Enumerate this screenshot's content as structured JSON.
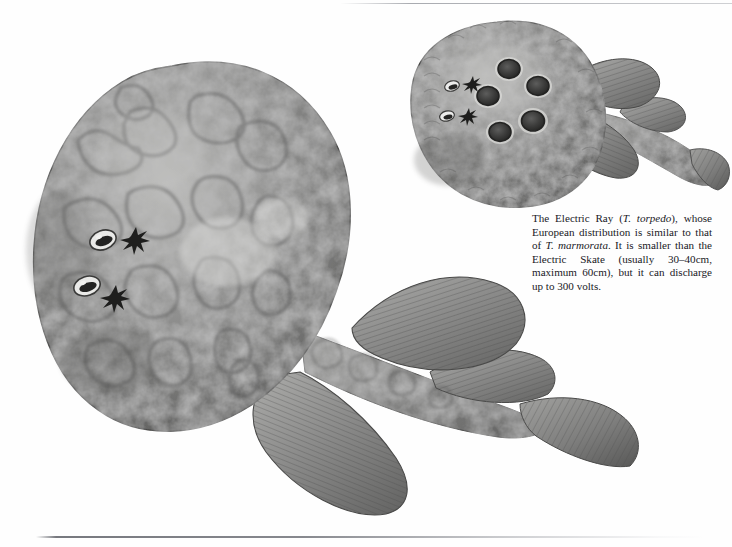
{
  "page": {
    "background_color": "#fefefe",
    "running_head": "",
    "bottom_rule_color": "#5f6168"
  },
  "caption": {
    "id": "electric-ray-caption",
    "segments": [
      {
        "text": "The Electric Ray (",
        "style": "normal"
      },
      {
        "text": "T. torpedo",
        "style": "italic"
      },
      {
        "text": "), whose European distribution is similar to that of ",
        "style": "normal"
      },
      {
        "text": "T. marmorata",
        "style": "italic"
      },
      {
        "text": ". It is smaller than the Electric Skate (usually 30–40cm, maximum 60cm), but it can discharge up to 300 volts.",
        "style": "normal"
      }
    ],
    "plain_text": "The Electric Ray (T. torpedo), whose European distribution is similar to that of T. marmorata. It is smaller than the Electric Skate (usually 30–40cm, maximum 60cm), but it can discharge up to 300 volts."
  },
  "figures": [
    {
      "name": "main-electric-ray",
      "label": "Large marbled electric ray, dorsal view, head upper-left, tail extending to lower-right",
      "species_hint": "Torpedo marmorata",
      "features": [
        "paired eyes",
        "paired spiracles",
        "mottled marbled skin pattern",
        "two dorsal fins",
        "caudal fin",
        "pelvic fins"
      ],
      "palette": {
        "dark": "#5c5c5c",
        "mid": "#868686",
        "light": "#b4b4b4",
        "highlight": "#d8d8d6",
        "outline": "#4a4a4a"
      }
    },
    {
      "name": "small-electric-ray",
      "label": "Smaller electric ray, dorsal view, with five dark ocelli (eye spots) on the disc",
      "species_hint": "Torpedo torpedo",
      "ocelli_count": 5,
      "features": [
        "paired eyes",
        "paired spiracles",
        "five ringed ocelli",
        "two dorsal fins",
        "caudal fin"
      ],
      "palette": {
        "dark": "#5a5a5a",
        "mid": "#838383",
        "light": "#aeaeae",
        "highlight": "#d4d4d2",
        "outline": "#484848"
      }
    }
  ]
}
